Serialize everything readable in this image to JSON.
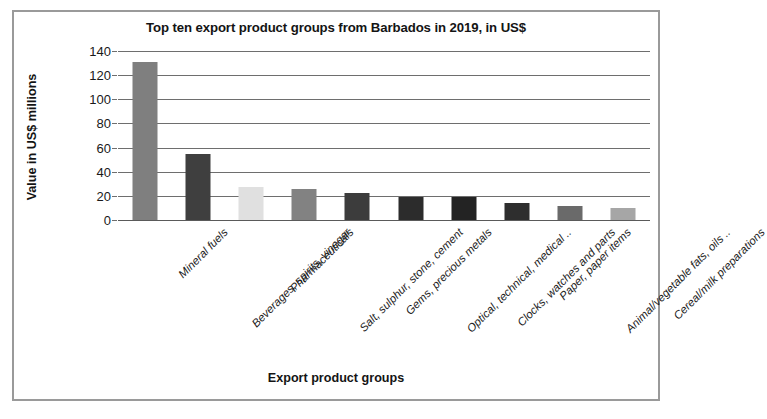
{
  "chart_data": {
    "type": "bar",
    "title": "Top ten export product groups from Barbados in 2019, in US$",
    "xlabel": "Export product groups",
    "ylabel": "Value in US$ millions",
    "ylim": [
      0,
      140
    ],
    "yticks": [
      0,
      20,
      40,
      60,
      80,
      100,
      120,
      140
    ],
    "ytick_labels": [
      "0",
      "20",
      "40",
      "60",
      "80",
      "100",
      "120",
      "140"
    ],
    "grid": true,
    "legend": false,
    "categories": [
      "Mineral fuels",
      "Beverages, spirits, vinegar",
      "Pharmaceuticals",
      "Salt, sulphur, stone, cement",
      "Gems, precious metals",
      "Optical, technical, medical ..",
      "Clocks, watches and parts",
      "Paper, paper items",
      "Animal/vegetable fats, oils ..",
      "Cereal/milk preparations"
    ],
    "values": [
      131,
      55,
      27,
      26,
      22,
      19,
      19,
      14,
      12,
      10
    ],
    "bar_colors": [
      "#7f7f7f",
      "#3f3f3f",
      "#e0e0e0",
      "#828282",
      "#3c3c3c",
      "#2c2c2c",
      "#232323",
      "#2e2e2e",
      "#6a6a6a",
      "#a6a6a6"
    ]
  },
  "style": {
    "frame_color": "#9a9a9a",
    "gridline_color": "#6e6e6e",
    "text_color": "#141414",
    "background": "#ffffff"
  }
}
